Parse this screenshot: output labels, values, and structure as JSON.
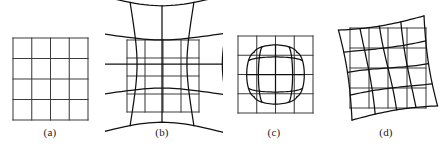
{
  "figure": {
    "background_color": "#ffffff",
    "width": 443,
    "height": 153,
    "straight_grid_color": "#3c3c3c",
    "distorted_grid_color": "#101010"
  },
  "panels": [
    {
      "id": "a",
      "caption": "(a)",
      "caption_x": 50,
      "caption_y": 128,
      "distortion": "none",
      "description": "undistorted reference grid",
      "rows": 4,
      "cols": 4,
      "bounds": {
        "x": 13,
        "y": 38,
        "w": 75,
        "h": 82
      },
      "has_straight_grid": true,
      "has_warped_grid": false
    },
    {
      "id": "b",
      "caption": "(b)",
      "caption_x": 162,
      "caption_y": 128,
      "distortion": "pincushion",
      "description": "pincushion distortion: grid edges pulled outward at corners",
      "rows": 4,
      "cols": 4,
      "bounds": {
        "x": 104,
        "y": 8,
        "w": 116,
        "h": 112
      },
      "straight_bounds": {
        "x": 127,
        "y": 40,
        "w": 72,
        "h": 72
      },
      "warp_strength": 0.3,
      "has_straight_grid": true,
      "has_warped_grid": true
    },
    {
      "id": "c",
      "caption": "(c)",
      "caption_x": 274,
      "caption_y": 128,
      "distortion": "barrel",
      "description": "barrel distortion: grid edges bowed inward, corners rounded",
      "rows": 4,
      "cols": 4,
      "bounds": {
        "x": 238,
        "y": 36,
        "w": 75,
        "h": 77
      },
      "warp_strength": -0.2,
      "has_straight_grid": true,
      "has_warped_grid": true
    },
    {
      "id": "d",
      "caption": "(d)",
      "caption_x": 386,
      "caption_y": 128,
      "distortion": "rotation",
      "description": "rotation with slight curvature over straight reference grid",
      "rows": 4,
      "cols": 4,
      "bounds": {
        "x": 350,
        "y": 28,
        "w": 76,
        "h": 80
      },
      "rotation_degrees": -9,
      "warp_strength": 0.07,
      "has_straight_grid": true,
      "has_warped_grid": true
    }
  ]
}
